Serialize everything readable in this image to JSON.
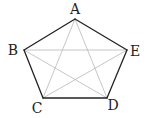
{
  "diagram": {
    "type": "regular-pentagon-with-diagonals",
    "colors": {
      "edge": "#222222",
      "diagonal": "#b8b8b8",
      "label": "#222222",
      "background": "#ffffff"
    },
    "vertices": [
      {
        "id": "A",
        "label": "A",
        "x": 75,
        "y": 19,
        "label_x": 75,
        "label_y": 14
      },
      {
        "id": "B",
        "label": "B",
        "x": 24,
        "y": 50,
        "label_x": 13,
        "label_y": 55
      },
      {
        "id": "C",
        "label": "C",
        "x": 43,
        "y": 98,
        "label_x": 37,
        "label_y": 113
      },
      {
        "id": "D",
        "label": "D",
        "x": 107,
        "y": 98,
        "label_x": 113,
        "label_y": 110
      },
      {
        "id": "E",
        "label": "E",
        "x": 127,
        "y": 50,
        "label_x": 135,
        "label_y": 56
      }
    ],
    "edges": [
      [
        "A",
        "B"
      ],
      [
        "B",
        "C"
      ],
      [
        "C",
        "D"
      ],
      [
        "D",
        "E"
      ],
      [
        "E",
        "A"
      ]
    ],
    "diagonals": [
      [
        "A",
        "C"
      ],
      [
        "A",
        "D"
      ],
      [
        "B",
        "D"
      ],
      [
        "B",
        "E"
      ],
      [
        "C",
        "E"
      ]
    ]
  }
}
